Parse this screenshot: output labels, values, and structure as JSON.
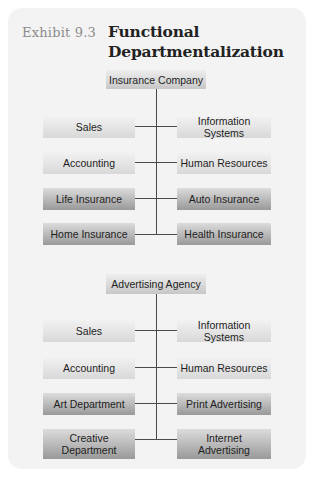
{
  "header": {
    "exhibit": "Exhibit 9.3",
    "title_line1": "Functional",
    "title_line2": "Departmentalization"
  },
  "charts": [
    {
      "root": "Insurance Company",
      "rows": [
        {
          "left": "Sales",
          "right": "Information Systems",
          "shade": "light"
        },
        {
          "left": "Accounting",
          "right": "Human Resources",
          "shade": "light"
        },
        {
          "left": "Life Insurance",
          "right": "Auto Insurance",
          "shade": "dark"
        },
        {
          "left": "Home Insurance",
          "right": "Health Insurance",
          "shade": "dark"
        }
      ]
    },
    {
      "root": "Advertising Agency",
      "rows": [
        {
          "left": "Sales",
          "right": "Information Systems",
          "shade": "light"
        },
        {
          "left": "Accounting",
          "right": "Human Resources",
          "shade": "light"
        },
        {
          "left": "Art Department",
          "right": "Print Advertising",
          "shade": "dark"
        },
        {
          "left": "Creative Department",
          "right": "Internet Advertising",
          "shade": "dark"
        }
      ]
    }
  ]
}
